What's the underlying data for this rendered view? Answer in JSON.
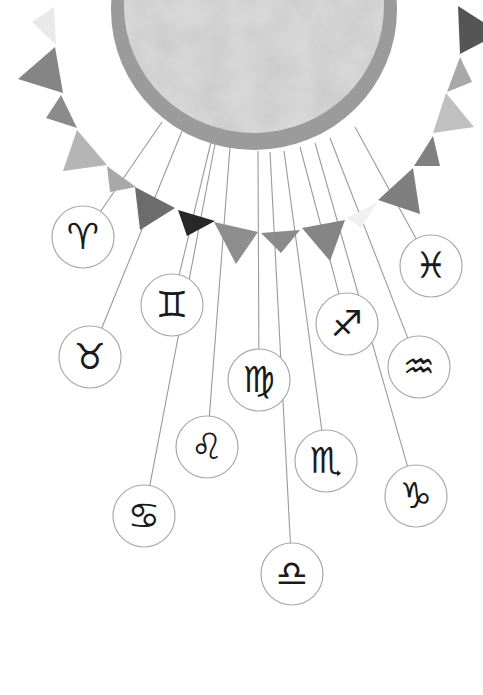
{
  "illustration": {
    "subject": "Sun with bunting garland and hanging zodiac sign medallions",
    "background": "#ffffff",
    "sun": {
      "cx": 254,
      "cy": 10,
      "rx": 143,
      "ry": 140,
      "fill": "#dcdcdc",
      "border": "#9b9b9b",
      "border_width": 13
    },
    "string_color": "#9a9a9a",
    "circle_stroke": "#a9a9a9",
    "bunting": [
      {
        "points": "54,7 56,45 32,22",
        "fill": "#e9e9e9"
      },
      {
        "points": "55,47 63,93 18,79",
        "fill": "#858585"
      },
      {
        "points": "61,95 77,128 46,118",
        "fill": "#8b8b8b"
      },
      {
        "points": "77,130 107,165 63,171",
        "fill": "#b5b5b5"
      },
      {
        "points": "107,166 136,187 110,192",
        "fill": "#a9a9a9"
      },
      {
        "points": "135,187 175,208 140,230",
        "fill": "#6c6c6c"
      },
      {
        "points": "178,210 215,221 187,236",
        "fill": "#282828"
      },
      {
        "points": "214,222 258,232 236,264",
        "fill": "#8e8e8e"
      },
      {
        "points": "261,233 300,230 281,253",
        "fill": "#8a8a8a"
      },
      {
        "points": "302,228 345,220 330,261",
        "fill": "#858585"
      },
      {
        "points": "347,218 378,202 361,228",
        "fill": "#f0f0f0"
      },
      {
        "points": "378,200 413,168 420,214",
        "fill": "#7f7f7f"
      },
      {
        "points": "414,166 433,136 440,166",
        "fill": "#808080"
      },
      {
        "points": "433,133 446,93 474,127",
        "fill": "#c0c0c0"
      },
      {
        "points": "447,92 460,57 472,82",
        "fill": "#a8a8a8"
      },
      {
        "points": "460,54 458,6 483,22 483,42",
        "fill": "#555555"
      }
    ],
    "signs": [
      {
        "name": "Aries",
        "glyph": "♈",
        "cx": 83,
        "cy": 237,
        "sx": 162,
        "sy": 122
      },
      {
        "name": "Taurus",
        "glyph": "♉",
        "cx": 90,
        "cy": 357,
        "sx": 182,
        "sy": 131
      },
      {
        "name": "Gemini",
        "glyph": "♊",
        "cx": 172,
        "cy": 305,
        "sx": 211,
        "sy": 142
      },
      {
        "name": "Cancer",
        "glyph": "♋",
        "cx": 144,
        "cy": 516,
        "sx": 215,
        "sy": 144
      },
      {
        "name": "Leo",
        "glyph": "♌",
        "cx": 207,
        "cy": 447,
        "sx": 230,
        "sy": 147
      },
      {
        "name": "Virgo",
        "glyph": "♍",
        "cx": 259,
        "cy": 380,
        "sx": 258,
        "sy": 151
      },
      {
        "name": "Libra",
        "glyph": "♎",
        "cx": 292,
        "cy": 574,
        "sx": 270,
        "sy": 152
      },
      {
        "name": "Scorpio",
        "glyph": "♏",
        "cx": 326,
        "cy": 461,
        "sx": 284,
        "sy": 151
      },
      {
        "name": "Sagittarius",
        "glyph": "♐",
        "cx": 347,
        "cy": 324,
        "sx": 300,
        "sy": 147
      },
      {
        "name": "Capricorn",
        "glyph": "♑",
        "cx": 416,
        "cy": 496,
        "sx": 315,
        "sy": 143
      },
      {
        "name": "Aquarius",
        "glyph": "♒",
        "cx": 419,
        "cy": 367,
        "sx": 330,
        "sy": 138
      },
      {
        "name": "Pisces",
        "glyph": "♓",
        "cx": 431,
        "cy": 266,
        "sx": 355,
        "sy": 127
      }
    ],
    "medallion_radius": 31
  }
}
